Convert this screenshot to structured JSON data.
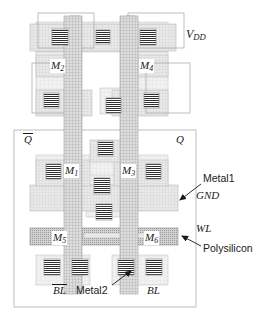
{
  "figure": {
    "kind": "vlsi-layout",
    "background": "#ffffff"
  },
  "layers": {
    "metal1": {
      "name": "Metal1",
      "color": "#d8d8d8",
      "hatch": "fine-grid"
    },
    "metal2": {
      "name": "Metal2",
      "color": "#c4c4c4",
      "hatch": "cross-hatch"
    },
    "polysilicon": {
      "name": "Polysilicon",
      "color": "#b0b0b0",
      "hatch": "dense-dots"
    },
    "diffusion": {
      "name": "Diffusion",
      "color": "#e6e6e6",
      "hatch": "light-grid"
    },
    "contact": {
      "name": "Contact",
      "color": "#4a4a4a",
      "hatch": "solid-lines"
    },
    "outline": {
      "name": "Cell boundary",
      "color": "#9a9a9a"
    }
  },
  "signals": {
    "vdd": {
      "text": "V",
      "sub": "DD",
      "x": 186,
      "y": 33
    },
    "gnd": {
      "text": "GND",
      "x": 196,
      "y": 196
    },
    "wl": {
      "text": "WL",
      "x": 196,
      "y": 228
    },
    "q_bar": {
      "text": "Q",
      "overline": true,
      "x": 23,
      "y": 134
    },
    "q": {
      "text": "Q",
      "overline": false,
      "x": 176,
      "y": 134
    },
    "bl_bar": {
      "text": "BL",
      "overline": true,
      "x": 55,
      "y": 288
    },
    "bl": {
      "text": "BL",
      "overline": false,
      "x": 148,
      "y": 288
    }
  },
  "transistors": [
    {
      "id": "M1",
      "label": "M",
      "sub": "1",
      "x": 63,
      "y": 168
    },
    {
      "id": "M2",
      "label": "M",
      "sub": "2",
      "x": 51,
      "y": 63
    },
    {
      "id": "M3",
      "label": "M",
      "sub": "3",
      "x": 122,
      "y": 168
    },
    {
      "id": "M4",
      "label": "M",
      "sub": "4",
      "x": 140,
      "y": 63
    },
    {
      "id": "M5",
      "label": "M",
      "sub": "5",
      "x": 53,
      "y": 237
    },
    {
      "id": "M6",
      "label": "M",
      "sub": "6",
      "x": 145,
      "y": 237
    }
  ],
  "callouts": [
    {
      "id": "metal1",
      "text": "Metal1",
      "x": 203,
      "y": 180,
      "leader": {
        "x1": 201,
        "y1": 185,
        "x2": 176,
        "y2": 203
      }
    },
    {
      "id": "polysilicon",
      "text": "Polysilicon",
      "x": 203,
      "y": 248,
      "leader": {
        "x1": 201,
        "y1": 246,
        "x2": 179,
        "y2": 235
      }
    },
    {
      "id": "metal2",
      "text": "Metal2",
      "x": 84,
      "y": 288,
      "leader": {
        "x1": 112,
        "y1": 287,
        "x2": 131,
        "y2": 272
      }
    }
  ],
  "legend_order": [
    "Metal1",
    "GND",
    "WL",
    "Polysilicon"
  ]
}
